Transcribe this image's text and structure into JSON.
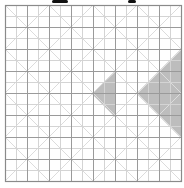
{
  "diagram": {
    "type": "grid-with-diagonal-lattice",
    "grid": {
      "origin_x": 5,
      "origin_y": 5,
      "cell_size": 11,
      "columns": 16,
      "rows": 16,
      "minor_color": "#d4d4d4",
      "major_every": 2,
      "major_color": "#9a9a9a",
      "border_color": "#8a8a8a"
    },
    "diagonals": {
      "spacing": 44,
      "color": "#dcdcdc"
    },
    "shaded_regions": [
      {
        "name": "small-triangle",
        "points": [
          [
            92,
            94
          ],
          [
            115,
            72
          ],
          [
            115,
            117
          ]
        ],
        "color": "#bdbdbd"
      },
      {
        "name": "large-triangle",
        "points": [
          [
            137,
            94
          ],
          [
            181,
            50
          ],
          [
            181,
            138
          ]
        ],
        "color": "#bdbdbd"
      }
    ],
    "cut_off_title_fragments": [
      {
        "x": 52,
        "width": 16
      },
      {
        "x": 128,
        "width": 8
      }
    ]
  }
}
